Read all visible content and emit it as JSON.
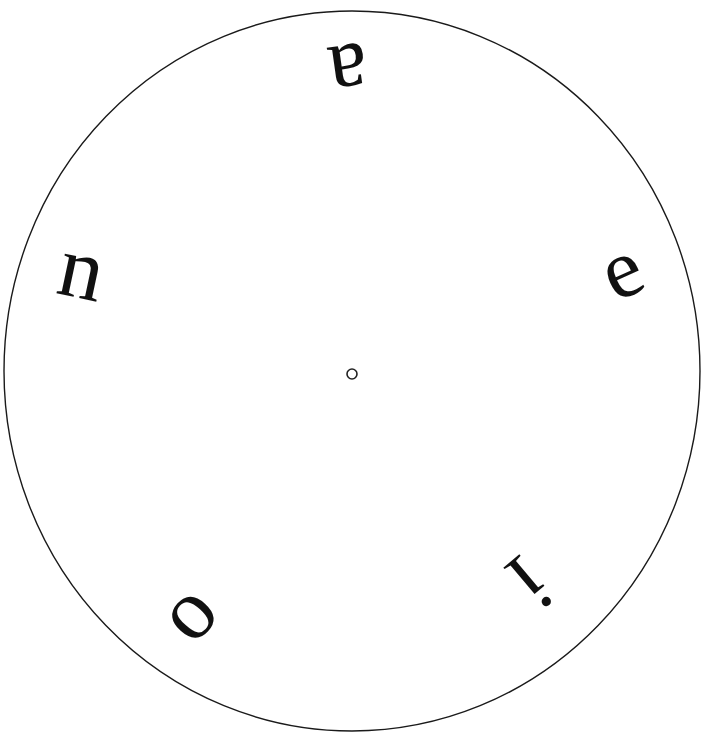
{
  "figure": {
    "kind": "vowel-disk",
    "background_color": "#ffffff",
    "ink_color": "#111111",
    "width": 717,
    "height": 748
  },
  "disk": {
    "name": "outer-circle",
    "center_x": 352,
    "center_y": 371,
    "radius_x": 348,
    "radius_y": 360,
    "stroke_color": "#1a1a1a",
    "stroke_width": 1.4,
    "fill": "none"
  },
  "hub": {
    "name": "center-pivot-hole",
    "center_x": 352,
    "center_y": 374,
    "radius": 5,
    "stroke_color": "#222222",
    "stroke_width": 1.6,
    "fill": "#ffffff"
  },
  "letters": [
    {
      "id": "letter-a",
      "text": "a",
      "x": 349,
      "y": 74,
      "font_size": 88,
      "rotation_deg": 172,
      "ring_position": "top"
    },
    {
      "id": "letter-e",
      "text": "e",
      "x": 621,
      "y": 269,
      "font_size": 84,
      "rotation_deg": -24,
      "ring_position": "right"
    },
    {
      "id": "letter-i",
      "text": "i",
      "x": 530,
      "y": 583,
      "font_size": 88,
      "rotation_deg": 140,
      "ring_position": "bottom-right"
    },
    {
      "id": "letter-o",
      "text": "o",
      "x": 186,
      "y": 611,
      "font_size": 86,
      "rotation_deg": -48,
      "ring_position": "bottom-left"
    },
    {
      "id": "letter-n",
      "text": "n",
      "x": 82,
      "y": 269,
      "font_size": 88,
      "rotation_deg": 12,
      "ring_position": "left"
    }
  ],
  "chart_data": {
    "type": "scatter",
    "title": "",
    "xlabel": "",
    "ylabel": "",
    "categories": [
      "a",
      "e",
      "i",
      "o",
      "n"
    ],
    "series": [
      {
        "name": "letter placement (polar, degrees clockwise from top / radius px)",
        "points": [
          {
            "label": "a",
            "angle_deg": 0,
            "radius_px": 297,
            "rotation_deg": 172
          },
          {
            "label": "e",
            "angle_deg": 72,
            "radius_px": 295,
            "rotation_deg": -24
          },
          {
            "label": "i",
            "angle_deg": 144,
            "radius_px": 273,
            "rotation_deg": 140
          },
          {
            "label": "o",
            "angle_deg": 216,
            "radius_px": 291,
            "rotation_deg": -48
          },
          {
            "label": "n",
            "angle_deg": 288,
            "radius_px": 290,
            "rotation_deg": 12
          }
        ]
      }
    ],
    "grid": false,
    "legend_position": "none"
  }
}
